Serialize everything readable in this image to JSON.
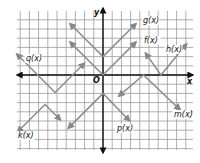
{
  "chart_data": {
    "type": "line",
    "title": "",
    "xlabel": "x",
    "ylabel": "y",
    "origin_label": "O",
    "xlim": [
      -9.5,
      9.5
    ],
    "ylim": [
      -7.5,
      6.5
    ],
    "grid": true,
    "tick_labels": false,
    "series": [
      {
        "name": "f(x)",
        "label": "f(x)",
        "points": [
          [
            -3.6,
            3.6
          ],
          [
            0,
            0
          ],
          [
            3.6,
            3.6
          ]
        ],
        "arrows": "both"
      },
      {
        "name": "g(x)",
        "label": "g(x)",
        "points": [
          [
            -3.6,
            5.6
          ],
          [
            0,
            2
          ],
          [
            3.6,
            5.6
          ]
        ],
        "arrows": "both"
      },
      {
        "name": "h(x)",
        "label": "h(x)",
        "points": [
          [
            4.6,
            2.4
          ],
          [
            6.3,
            0
          ],
          [
            9.1,
            3.4
          ]
        ],
        "arrows": "both"
      },
      {
        "name": "m(x)",
        "label": "m(x)",
        "points": [
          [
            1.7,
            -2.3
          ],
          [
            4.4,
            0
          ],
          [
            8.4,
            -3.8
          ]
        ],
        "arrows": "both"
      },
      {
        "name": "p(x)",
        "label": "p(x)",
        "points": [
          [
            -3.8,
            -5.8
          ],
          [
            0,
            -2
          ],
          [
            2.9,
            -5
          ]
        ],
        "arrows": "both"
      },
      {
        "name": "q(x)",
        "label": "q(x)",
        "points": [
          [
            -9.4,
            2.3
          ],
          [
            -5.2,
            -1.9
          ],
          [
            -2,
            1.3
          ]
        ],
        "arrows": "both"
      },
      {
        "name": "k(x)",
        "label": "k(x)",
        "points": [
          [
            -9.3,
            -6.2
          ],
          [
            -6.3,
            -3.2
          ],
          [
            -4.6,
            -4.9
          ]
        ],
        "arrows": "both"
      }
    ]
  }
}
